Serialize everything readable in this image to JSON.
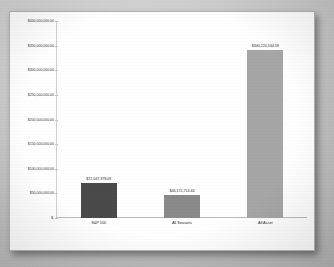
{
  "chart_data": {
    "type": "bar",
    "title": "",
    "xlabel": "",
    "ylabel": "",
    "categories": [
      "S&P 500",
      "All Seasons",
      "All Asset"
    ],
    "values": [
      72047378.09,
      46171713.44,
      340220534.59
    ],
    "value_labels": [
      "$72,047,378.09",
      "$46,171,713.44",
      "$340,220,534.59"
    ],
    "series": [
      {
        "name": "Portfolio Value",
        "values": [
          72047378.09,
          46171713.44,
          340220534.59
        ]
      }
    ],
    "ylim": [
      0,
      400000000
    ],
    "yticks": [
      0,
      50000000,
      100000000,
      150000000,
      200000000,
      250000000,
      300000000,
      350000000,
      400000000
    ],
    "ytick_labels": [
      "$-",
      "$50,000,000.00",
      "$100,000,000.00",
      "$150,000,000.00",
      "$200,000,000.00",
      "$250,000,000.00",
      "$300,000,000.00",
      "$350,000,000.00",
      "$400,000,000.00"
    ],
    "grid": false,
    "legend": "none",
    "bar_colors": [
      "#4a4a4a",
      "#8a8a8a",
      "#a6a6a6"
    ]
  },
  "panel": {
    "background": "#ffffff",
    "border_color": "#b4b4b4"
  },
  "page": {
    "background": "#c9c9c9"
  }
}
